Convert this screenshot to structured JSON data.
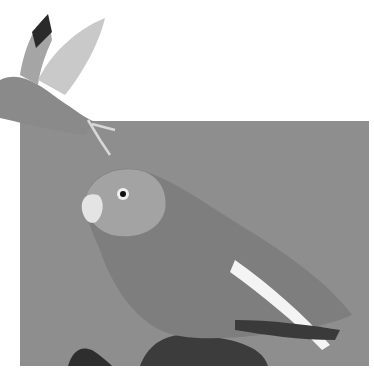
{
  "image": {
    "description": "Grayscale photograph of two lovebirds: one flying at upper left, one perched on a stump against a gray backdrop",
    "subjects": [
      "flying-lovebird",
      "perched-lovebird",
      "tree-stump"
    ],
    "colors": {
      "background": "#ffffff",
      "backdrop": "#8e8e8e",
      "bird_body": "#7a7a7a",
      "bird_light": "#d8d8d8",
      "stump": "#3a3a3a"
    }
  }
}
